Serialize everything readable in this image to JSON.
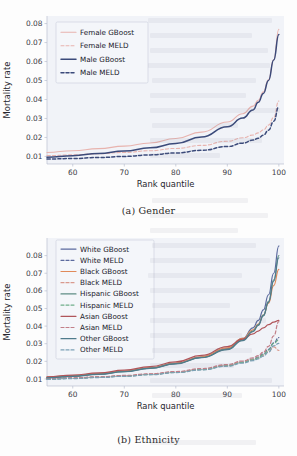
{
  "document": {
    "type": "figure-pair",
    "background_note": "faint ghost text from reverse side of scanned page"
  },
  "figures": [
    {
      "id": "a",
      "caption": "(a) Gender"
    },
    {
      "id": "b",
      "caption": "(b) Ethnicity"
    }
  ],
  "chart_data": [
    {
      "type": "line",
      "title": "",
      "caption": "(a) Gender",
      "xlabel": "Rank quantile",
      "ylabel": "Mortality rate",
      "xlim": [
        55,
        101
      ],
      "ylim": [
        0.006,
        0.084
      ],
      "xticks": [
        60,
        70,
        80,
        90,
        100
      ],
      "yticks": [
        0.01,
        0.02,
        0.03,
        0.04,
        0.05,
        0.06,
        0.07,
        0.08
      ],
      "xticklabels": [
        "60",
        "70",
        "80",
        "90",
        "100"
      ],
      "yticklabels": [
        "0.01",
        "0.02",
        "0.03",
        "0.04",
        "0.05",
        "0.06",
        "0.07",
        "0.08"
      ],
      "grid": false,
      "legend_position": "upper left",
      "x": [
        55,
        60,
        65,
        70,
        75,
        80,
        85,
        90,
        93,
        95,
        96,
        97,
        98,
        99,
        100
      ],
      "series": [
        {
          "name": "Female GBoost",
          "color": "#e8b3ae",
          "dash": "solid",
          "width": 1.1,
          "values": [
            0.0121,
            0.013,
            0.0141,
            0.0154,
            0.0171,
            0.0194,
            0.0228,
            0.0281,
            0.0325,
            0.0365,
            0.0396,
            0.044,
            0.0505,
            0.061,
            0.077
          ]
        },
        {
          "name": "Female MELD",
          "color": "#e8b3ae",
          "dash": "dashed",
          "width": 1.1,
          "values": [
            0.0104,
            0.0108,
            0.0114,
            0.0121,
            0.013,
            0.0142,
            0.0158,
            0.018,
            0.0198,
            0.0213,
            0.0224,
            0.024,
            0.0265,
            0.0305,
            0.0392
          ]
        },
        {
          "name": "Male GBoost",
          "color": "#3b4a7a",
          "dash": "solid",
          "width": 1.5,
          "values": [
            0.0096,
            0.0104,
            0.0115,
            0.0128,
            0.0145,
            0.0168,
            0.0202,
            0.0256,
            0.0302,
            0.0345,
            0.0385,
            0.0432,
            0.05,
            0.0608,
            0.0742
          ]
        },
        {
          "name": "Male MELD",
          "color": "#3b4a7a",
          "dash": "dashed",
          "width": 1.5,
          "values": [
            0.0086,
            0.0089,
            0.0094,
            0.01,
            0.0108,
            0.0118,
            0.0132,
            0.0152,
            0.017,
            0.0186,
            0.0196,
            0.0212,
            0.0238,
            0.0285,
            0.0362
          ]
        }
      ]
    },
    {
      "type": "line",
      "title": "",
      "caption": "(b) Ethnicity",
      "xlabel": "Rank quantile",
      "ylabel": "Mortality rate",
      "xlim": [
        55,
        101
      ],
      "ylim": [
        0.006,
        0.09
      ],
      "xticks": [
        60,
        70,
        80,
        90,
        100
      ],
      "yticks": [
        0.01,
        0.02,
        0.03,
        0.04,
        0.05,
        0.06,
        0.07,
        0.08
      ],
      "xticklabels": [
        "60",
        "70",
        "80",
        "90",
        "100"
      ],
      "yticklabels": [
        "0.01",
        "0.02",
        "0.03",
        "0.04",
        "0.05",
        "0.06",
        "0.07",
        "0.08"
      ],
      "grid": false,
      "legend_position": "upper left",
      "x": [
        55,
        60,
        65,
        70,
        75,
        80,
        85,
        90,
        93,
        95,
        96,
        97,
        98,
        99,
        100
      ],
      "series": [
        {
          "name": "White GBoost",
          "color": "#5b6a9e",
          "dash": "solid",
          "width": 1.2,
          "values": [
            0.0108,
            0.0117,
            0.0128,
            0.0143,
            0.0162,
            0.0188,
            0.0224,
            0.0272,
            0.033,
            0.039,
            0.0432,
            0.0492,
            0.0578,
            0.07,
            0.0855
          ]
        },
        {
          "name": "White MELD",
          "color": "#5b6a9e",
          "dash": "dashed",
          "width": 1.2,
          "values": [
            0.01,
            0.0104,
            0.011,
            0.0117,
            0.0126,
            0.0138,
            0.0154,
            0.0176,
            0.0196,
            0.0212,
            0.0224,
            0.0242,
            0.0268,
            0.0305,
            0.0335
          ]
        },
        {
          "name": "Black GBoost",
          "color": "#e08a5a",
          "dash": "solid",
          "width": 1.2,
          "values": [
            0.011,
            0.0119,
            0.013,
            0.0145,
            0.0164,
            0.019,
            0.0226,
            0.0276,
            0.033,
            0.0378,
            0.0412,
            0.0462,
            0.053,
            0.063,
            0.0722
          ]
        },
        {
          "name": "Black MELD",
          "color": "#d99a8e",
          "dash": "dashed",
          "width": 1.2,
          "values": [
            0.0101,
            0.0105,
            0.0111,
            0.0118,
            0.0127,
            0.0139,
            0.0155,
            0.0177,
            0.0196,
            0.021,
            0.022,
            0.0235,
            0.0255,
            0.0282,
            0.0262
          ]
        },
        {
          "name": "Hispanic GBoost",
          "color": "#5f8d85",
          "dash": "solid",
          "width": 1.2,
          "values": [
            0.0107,
            0.0116,
            0.0127,
            0.0142,
            0.0161,
            0.0187,
            0.0222,
            0.0268,
            0.0322,
            0.0372,
            0.0408,
            0.0462,
            0.054,
            0.0662,
            0.08
          ]
        },
        {
          "name": "Hispanic MELD",
          "color": "#6fae8a",
          "dash": "dashed",
          "width": 1.2,
          "values": [
            0.0099,
            0.0103,
            0.0109,
            0.0116,
            0.0125,
            0.0137,
            0.0153,
            0.0175,
            0.0194,
            0.0209,
            0.022,
            0.0238,
            0.0264,
            0.0302,
            0.0322
          ]
        },
        {
          "name": "Asian GBoost",
          "color": "#b0555a",
          "dash": "solid",
          "width": 1.2,
          "values": [
            0.0112,
            0.0122,
            0.0134,
            0.015,
            0.017,
            0.0197,
            0.0234,
            0.0284,
            0.0326,
            0.0356,
            0.0372,
            0.039,
            0.0408,
            0.0422,
            0.0432
          ]
        },
        {
          "name": "Asian MELD",
          "color": "#c27f88",
          "dash": "dashed",
          "width": 1.2,
          "values": [
            0.0102,
            0.0106,
            0.0112,
            0.012,
            0.0129,
            0.0142,
            0.0159,
            0.0182,
            0.0202,
            0.022,
            0.0232,
            0.0252,
            0.0285,
            0.0345,
            0.0425
          ]
        },
        {
          "name": "Other GBoost",
          "color": "#4f7b8c",
          "dash": "solid",
          "width": 1.2,
          "values": [
            0.0106,
            0.0115,
            0.0126,
            0.0141,
            0.016,
            0.0186,
            0.0221,
            0.0266,
            0.0318,
            0.0368,
            0.0404,
            0.0458,
            0.0535,
            0.0655,
            0.0788
          ]
        },
        {
          "name": "Other MELD",
          "color": "#7ba0b5",
          "dash": "dashed",
          "width": 1.2,
          "values": [
            0.0098,
            0.0102,
            0.0108,
            0.0115,
            0.0124,
            0.0136,
            0.0151,
            0.0172,
            0.019,
            0.0204,
            0.0214,
            0.023,
            0.0252,
            0.0288,
            0.0302
          ]
        }
      ]
    }
  ]
}
